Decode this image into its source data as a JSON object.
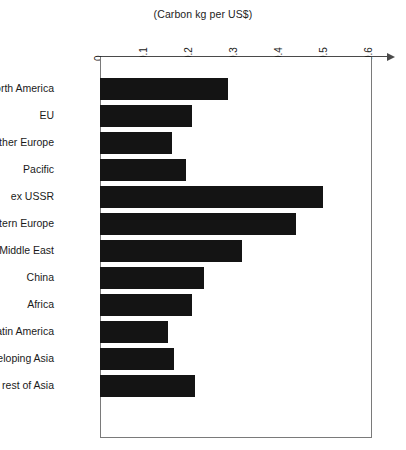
{
  "chart_data": {
    "type": "bar",
    "orientation": "horizontal",
    "title": "(Carbon kg per US$)",
    "xlabel": "",
    "ylabel": "",
    "xlim": [
      0,
      0.6
    ],
    "grid": false,
    "legend": null,
    "xticks": [
      "0",
      "0.1",
      "0.2",
      "0.3",
      "0.4",
      "0.5",
      "0.6"
    ],
    "xtick_values": [
      0,
      0.1,
      0.2,
      0.3,
      0.4,
      0.5,
      0.6
    ],
    "bar_color": "#141414",
    "categories": [
      "North America",
      "EU",
      "other Europe",
      "Pacific",
      "ex USSR",
      "Eastern Europe",
      "Middle East",
      "China",
      "Africa",
      "Latin America",
      "developing Asia",
      "rest of Asia"
    ],
    "values": [
      0.285,
      0.205,
      0.16,
      0.19,
      0.495,
      0.435,
      0.315,
      0.23,
      0.205,
      0.15,
      0.165,
      0.21
    ]
  },
  "artifact": {
    "bottom_text": ""
  }
}
